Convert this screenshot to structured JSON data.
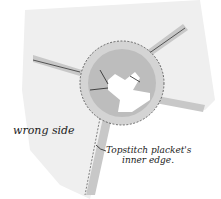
{
  "diagram": {
    "labels": {
      "wrong_side": "wrong side",
      "topstitch_line1": "Topstitch placket's",
      "topstitch_line2": "inner edge."
    },
    "colors": {
      "fabric": "#efefef",
      "seam_allowance": "#c8c8c8",
      "placket": "#d0d0d0",
      "ink": "#222222"
    }
  }
}
